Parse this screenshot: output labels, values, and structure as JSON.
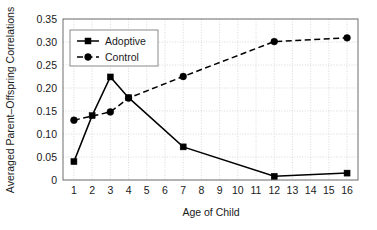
{
  "chart_data": {
    "type": "line",
    "title": "",
    "xlabel": "Age of Child",
    "ylabel": "Averaged Parent–Offspring Correlations",
    "xlim": [
      0.4,
      16.6
    ],
    "ylim": [
      0,
      0.35
    ],
    "grid": true,
    "legend_position": "top-left",
    "x_ticks": [
      1,
      2,
      3,
      4,
      5,
      6,
      7,
      8,
      9,
      10,
      11,
      12,
      13,
      14,
      15,
      16
    ],
    "x_tick_labels": [
      "1",
      "2",
      "3",
      "4",
      "5",
      "6",
      "7",
      "8",
      "9",
      "10",
      "11",
      "12",
      "13",
      "14",
      "15",
      "16"
    ],
    "y_ticks": [
      0,
      0.05,
      0.1,
      0.15,
      0.2,
      0.25,
      0.3,
      0.35
    ],
    "y_tick_labels": [
      "0",
      "0.05",
      "0.10",
      "0.15",
      "0.20",
      "0.25",
      "0.30",
      "0.35"
    ],
    "series": [
      {
        "name": "Adoptive",
        "marker": "square",
        "line_style": "solid",
        "color": "#000000",
        "x": [
          1,
          2,
          3,
          4,
          7,
          12,
          16
        ],
        "values": [
          0.04,
          0.14,
          0.224,
          0.179,
          0.072,
          0.008,
          0.015
        ]
      },
      {
        "name": "Control",
        "marker": "circle",
        "line_style": "dashed",
        "color": "#000000",
        "x": [
          1,
          3,
          4,
          7,
          12,
          16
        ],
        "values": [
          0.13,
          0.148,
          0.178,
          0.225,
          0.301,
          0.309
        ]
      }
    ],
    "legend": [
      "Adoptive",
      "Control"
    ]
  }
}
